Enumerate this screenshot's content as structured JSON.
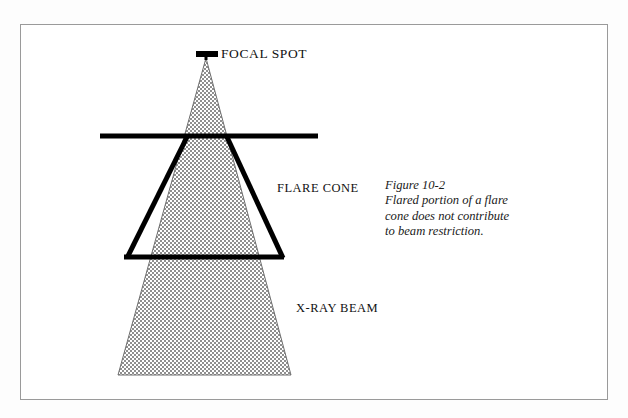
{
  "figure": {
    "caption_title": "Figure 10-2",
    "caption_lines": [
      "Flared portion of a flare",
      "cone does not contribute",
      "to beam restriction."
    ],
    "labels": {
      "focal_spot": "FOCAL SPOT",
      "flare_cone": "FLARE CONE",
      "xray_beam": "X-RAY BEAM"
    },
    "colors": {
      "page_background": "#ffffff",
      "frame_border": "#9a9a9a",
      "ink": "#111111",
      "beam_fill": "#9d9d9d",
      "outline": "#000000"
    },
    "geometry": {
      "frame": {
        "x": 20,
        "y": 24,
        "width": 588,
        "height": 376
      },
      "focal_spot_bar": {
        "x1": 197,
        "y1": 54,
        "x2": 217,
        "y2": 54,
        "thickness": 5
      },
      "beam_apex": {
        "x": 206,
        "y": 56
      },
      "beam_base": {
        "left_x": 118,
        "right_x": 291,
        "y": 375
      },
      "flare_top_bar": {
        "x1": 100,
        "y1": 136,
        "x2": 318,
        "y2": 136,
        "thickness": 5
      },
      "flare_left_edge": {
        "x1": 186,
        "y1": 137,
        "x2": 127,
        "y2": 258
      },
      "flare_right_edge": {
        "x1": 228,
        "y1": 137,
        "x2": 283,
        "y2": 258
      },
      "flare_bottom_bar": {
        "x1": 125,
        "y1": 258,
        "x2": 283,
        "y2": 258
      }
    }
  }
}
